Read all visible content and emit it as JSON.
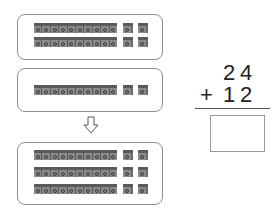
{
  "problem": {
    "addend1": {
      "tens": "2",
      "ones": "4"
    },
    "operator": "+",
    "addend2": {
      "tens": "1",
      "ones": "2"
    },
    "answer": ""
  },
  "panels": [
    {
      "label": "24",
      "tens_rods": 2,
      "ones_cubes": 4
    },
    {
      "label": "12",
      "tens_rods": 1,
      "ones_cubes": 2
    },
    {
      "label": "36",
      "tens_rods": 3,
      "ones_cubes": 6
    }
  ],
  "arrow": {
    "icon": "down-arrow-icon"
  },
  "colors": {
    "block_top": "#5a5a5a",
    "block_front": "#8a8a8a",
    "border": "#8f8f8f"
  }
}
